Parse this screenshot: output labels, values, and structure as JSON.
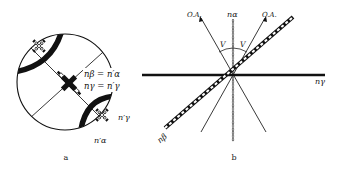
{
  "figure": {
    "panels": [
      {
        "id": "a",
        "caption": "a",
        "description": "Interference figure (conoscopic view) with isogyres and extinction crosses",
        "labels": {
          "eq1_left": "nβ = n′α",
          "eq2_left": "nγ = n′γ",
          "n_gamma_prime": "n′γ",
          "n_alpha_prime": "n′α"
        }
      },
      {
        "id": "b",
        "caption": "b",
        "description": "Optical indicatrix section showing optic axes and optic angle V",
        "labels": {
          "optic_axis_left": "O.A.",
          "optic_axis_right": "O.A.",
          "n_alpha": "nα",
          "n_beta": "nβ",
          "n_gamma": "nγ",
          "v_left": "V",
          "v_right": "V"
        }
      }
    ],
    "colors": {
      "ink": "#111111",
      "background": "#ffffff"
    }
  }
}
